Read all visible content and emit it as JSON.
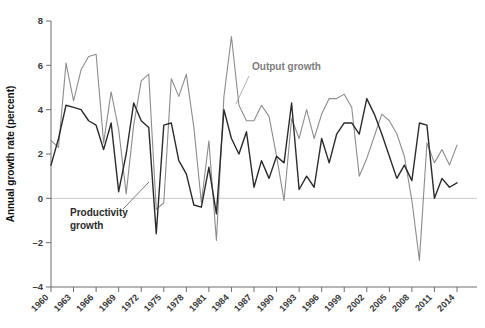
{
  "chart_data": {
    "type": "line",
    "title": "",
    "xlabel": "",
    "ylabel": "Annual growth rate (percent)",
    "xlim": [
      1960,
      2014
    ],
    "ylim": [
      -4,
      8
    ],
    "yticks": [
      8,
      6,
      4,
      2,
      0,
      -2,
      -4
    ],
    "ytick_labels": [
      "8",
      "6",
      "4",
      "2",
      "0",
      "–2",
      "–4"
    ],
    "xticks": [
      1960,
      1963,
      1966,
      1969,
      1972,
      1975,
      1978,
      1981,
      1984,
      1987,
      1990,
      1993,
      1996,
      1999,
      2002,
      2005,
      2008,
      2011,
      2014
    ],
    "xtick_labels": [
      "1960",
      "1963",
      "1966",
      "1969",
      "1972",
      "1975",
      "1978",
      "1981",
      "1984",
      "1987",
      "1990",
      "1993",
      "1996",
      "1999",
      "2002",
      "2005",
      "2008",
      "2011",
      "2014"
    ],
    "grid": false,
    "zero_line": true,
    "legend_position": "annotations",
    "x": [
      1960,
      1961,
      1962,
      1963,
      1964,
      1965,
      1966,
      1967,
      1968,
      1969,
      1970,
      1971,
      1972,
      1973,
      1974,
      1975,
      1976,
      1977,
      1978,
      1979,
      1980,
      1981,
      1982,
      1983,
      1984,
      1985,
      1986,
      1987,
      1988,
      1989,
      1990,
      1991,
      1992,
      1993,
      1994,
      1995,
      1996,
      1997,
      1998,
      1999,
      2000,
      2001,
      2002,
      2003,
      2004,
      2005,
      2006,
      2007,
      2008,
      2009,
      2010,
      2011,
      2012,
      2013,
      2014
    ],
    "series": [
      {
        "name": "Output growth",
        "color": "#8c8c8c",
        "values": [
          2.6,
          2.3,
          6.1,
          4.4,
          5.8,
          6.4,
          6.5,
          2.5,
          4.8,
          3.1,
          0.2,
          3.3,
          5.3,
          5.6,
          -0.5,
          -0.2,
          5.4,
          4.6,
          5.6,
          3.2,
          -0.2,
          2.6,
          -1.9,
          4.6,
          7.3,
          4.2,
          3.5,
          3.5,
          4.2,
          3.7,
          1.9,
          -0.1,
          3.6,
          2.7,
          4.0,
          2.7,
          3.8,
          4.5,
          4.5,
          4.7,
          4.1,
          1.0,
          1.8,
          2.8,
          3.8,
          3.5,
          2.9,
          1.9,
          -0.1,
          -2.8,
          2.5,
          1.6,
          2.2,
          1.5,
          2.4
        ]
      },
      {
        "name": "Productivity growth",
        "color": "#2b2b2b",
        "values": [
          1.5,
          2.7,
          4.2,
          4.1,
          4.0,
          3.5,
          3.3,
          2.2,
          3.4,
          0.3,
          2.0,
          4.3,
          3.5,
          3.2,
          -1.6,
          3.3,
          3.4,
          1.7,
          1.1,
          -0.3,
          -0.4,
          1.4,
          -0.7,
          4.0,
          2.7,
          2.0,
          3.0,
          0.5,
          1.7,
          0.9,
          1.9,
          1.6,
          4.3,
          0.4,
          1.0,
          0.5,
          2.7,
          1.6,
          2.9,
          3.4,
          3.4,
          2.9,
          4.5,
          3.8,
          2.9,
          1.9,
          0.9,
          1.5,
          0.8,
          3.4,
          3.3,
          0.0,
          0.9,
          0.5,
          0.7
        ]
      }
    ],
    "annotations": [
      {
        "text": "Output growth",
        "series": "Output growth",
        "x_px": 252,
        "y_px": 70,
        "leader_from_x": 249,
        "leader_from_y": 76,
        "leader_to_x": 236,
        "leader_to_y": 104
      },
      {
        "text_line1": "Productivity",
        "text_line2": "growth",
        "series": "Productivity growth",
        "x_px": 70,
        "y_px": 216,
        "leader_from_x": 123,
        "leader_from_y": 209,
        "leader_to_x": 149,
        "leader_to_y": 182
      }
    ]
  },
  "axis": {
    "y_title": "Annual growth rate (percent)"
  },
  "colors": {
    "output": "#8c8c8c",
    "productivity": "#2b2b2b",
    "axis": "#6e6e6e",
    "zero_line": "#c9c9c9",
    "background": "#ffffff"
  }
}
